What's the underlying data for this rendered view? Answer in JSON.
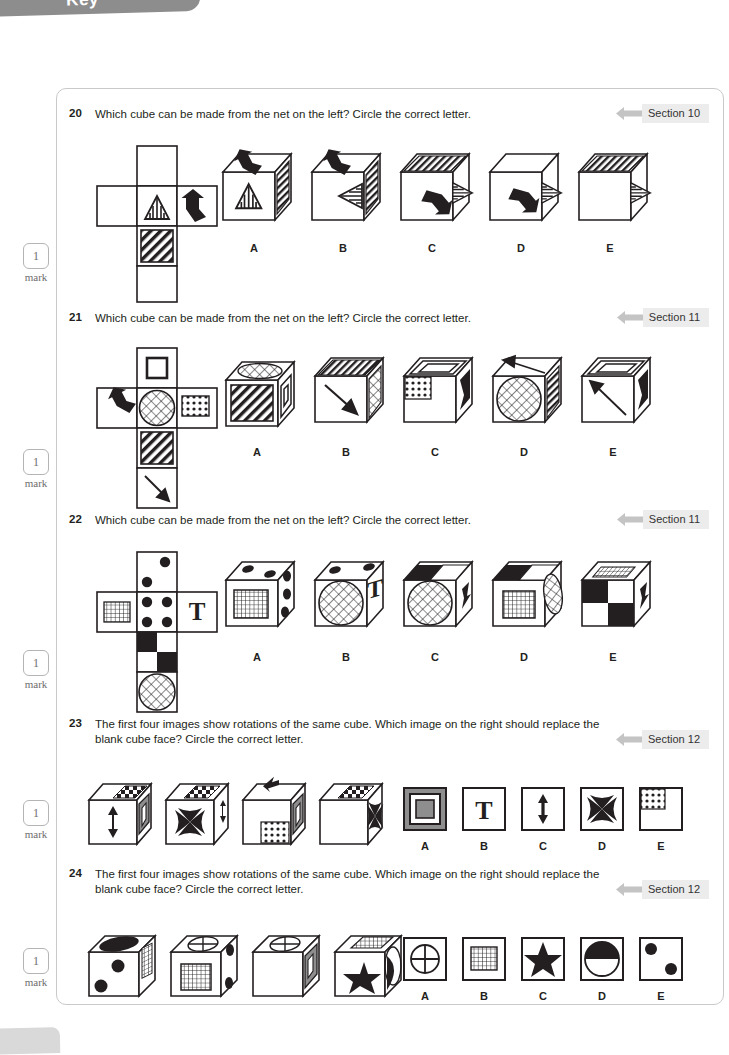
{
  "page": {
    "header_tab_text": "Key",
    "mark_chips": [
      {
        "num": "1",
        "label": "mark"
      },
      {
        "num": "1",
        "label": "mark"
      },
      {
        "num": "1",
        "label": "mark"
      },
      {
        "num": "1",
        "label": "mark"
      },
      {
        "num": "1",
        "label": "mark"
      }
    ]
  },
  "questions": [
    {
      "number": "20",
      "text": "Which cube can be made from the net on the left? Circle the correct letter.",
      "section": "Section 10",
      "options": [
        "A",
        "B",
        "C",
        "D",
        "E"
      ],
      "net": {
        "type": "cross-net",
        "faces": [
          {
            "cell": "top",
            "pattern": "blank"
          },
          {
            "cell": "middle-left",
            "pattern": "blank"
          },
          {
            "cell": "middle-center",
            "pattern": "striped-triangle"
          },
          {
            "cell": "middle-right",
            "pattern": "bold-arrow-up-left"
          },
          {
            "cell": "lower-center",
            "pattern": "diagonal-stripes"
          },
          {
            "cell": "bottom",
            "pattern": "blank"
          }
        ]
      },
      "choices": [
        {
          "letter": "A",
          "front": "striped-triangle-up",
          "top": "bold-arrow-up-left",
          "side": "diagonal-stripes"
        },
        {
          "letter": "B",
          "front": "striped-triangle-left",
          "top": "bold-arrow-up-left",
          "side": "diagonal-stripes"
        },
        {
          "letter": "C",
          "front": "bold-arrow-down-right",
          "top": "diagonal-stripes",
          "side": "striped-triangle"
        },
        {
          "letter": "D",
          "front": "bold-arrow-down-right",
          "top": "blank",
          "side": "striped-triangle"
        },
        {
          "letter": "E",
          "front": "blank",
          "top": "diagonal-stripes",
          "side": "striped-triangle"
        }
      ]
    },
    {
      "number": "21",
      "text": "Which cube can be made from the net on the left? Circle the correct letter.",
      "section": "Section 11",
      "options": [
        "A",
        "B",
        "C",
        "D",
        "E"
      ],
      "net": {
        "type": "cross-net",
        "faces": [
          {
            "cell": "top",
            "pattern": "square-outline"
          },
          {
            "cell": "middle-left",
            "pattern": "bold-arrow-up-left"
          },
          {
            "cell": "middle-center",
            "pattern": "crosshatch-circle"
          },
          {
            "cell": "middle-right",
            "pattern": "polka-dots"
          },
          {
            "cell": "lower-center",
            "pattern": "diagonal-stripes"
          },
          {
            "cell": "bottom",
            "pattern": "thin-arrow-down-right"
          }
        ]
      },
      "choices": [
        {
          "letter": "A",
          "front": "diagonal-stripes",
          "top": "crosshatch-ellipse",
          "side": "square-outline"
        },
        {
          "letter": "B",
          "front": "thin-arrow-down-right",
          "top": "diagonal-stripes",
          "side": "crosshatch"
        },
        {
          "letter": "C",
          "front": "polka-dots-corner",
          "top": "square-outline",
          "side": "bold-arrow"
        },
        {
          "letter": "D",
          "front": "crosshatch-circle",
          "top": "thin-arrow-up-left",
          "side": "diagonal-stripes"
        },
        {
          "letter": "E",
          "front": "thin-arrow-up-left",
          "top": "square-outline",
          "side": "bold-arrow"
        }
      ]
    },
    {
      "number": "22",
      "text": "Which cube can be made from the net on the left? Circle the correct letter.",
      "section": "Section 11",
      "options": [
        "A",
        "B",
        "C",
        "D",
        "E"
      ],
      "net": {
        "type": "cross-net",
        "faces": [
          {
            "cell": "top",
            "pattern": "dice-one-dot"
          },
          {
            "cell": "middle-left",
            "pattern": "fine-grid"
          },
          {
            "cell": "middle-center",
            "pattern": "dice-five-dots"
          },
          {
            "cell": "middle-right",
            "pattern": "letter-T"
          },
          {
            "cell": "lower-center",
            "pattern": "checker-quad"
          },
          {
            "cell": "bottom",
            "pattern": "crosshatch-circle"
          }
        ]
      },
      "choices": [
        {
          "letter": "A",
          "front": "fine-grid",
          "top": "dice-dots",
          "side": "dice-dots"
        },
        {
          "letter": "B",
          "front": "crosshatch-circle",
          "top": "dice-dots",
          "side": "letter-T"
        },
        {
          "letter": "C",
          "front": "crosshatch-circle",
          "top": "checker-quad",
          "side": "letter-T"
        },
        {
          "letter": "D",
          "front": "fine-grid",
          "top": "checker-quad",
          "side": "crosshatch-ellipse"
        },
        {
          "letter": "E",
          "front": "checker-quad",
          "top": "fine-grid",
          "side": "letter-T"
        }
      ]
    },
    {
      "number": "23",
      "text": "The first four images show rotations of the same cube. Which image on the right should replace the blank cube face? Circle the correct letter.",
      "section": "Section 12",
      "options": [
        "A",
        "B",
        "C",
        "D",
        "E"
      ],
      "cubes": [
        {
          "front": "double-arrow-vertical",
          "top": "checkerboard",
          "side": "grey-square-frame"
        },
        {
          "front": "four-point-star-burst",
          "top": "checkerboard",
          "side": "double-arrow-vertical"
        },
        {
          "front": "polka-dots-corner",
          "top": "letter-T-rotated",
          "side": "grey-square-frame"
        },
        {
          "front": "blank",
          "top": "checkerboard",
          "side": "four-point-star-burst"
        }
      ],
      "choices": [
        {
          "letter": "A",
          "pattern": "grey-square-frame"
        },
        {
          "letter": "B",
          "pattern": "letter-T"
        },
        {
          "letter": "C",
          "pattern": "double-arrow-vertical"
        },
        {
          "letter": "D",
          "pattern": "four-point-star-burst"
        },
        {
          "letter": "E",
          "pattern": "polka-dots-corner"
        }
      ]
    },
    {
      "number": "24",
      "text": "The first four images show rotations of the same cube. Which image on the right should replace the blank cube face? Circle the correct letter.",
      "section": "Section 12",
      "options": [
        "A",
        "B",
        "C",
        "D",
        "E"
      ],
      "cubes": [
        {
          "front": "two-dots",
          "top": "half-filled-ellipse",
          "side": "fine-grid"
        },
        {
          "front": "fine-grid",
          "top": "crossed-circle",
          "side": "two-dots"
        },
        {
          "front": "blank",
          "top": "crossed-circle",
          "side": "grey-square-frame"
        },
        {
          "front": "five-point-star",
          "top": "fine-grid",
          "side": "half-filled-ellipse"
        }
      ],
      "choices": [
        {
          "letter": "A",
          "pattern": "crossed-circle"
        },
        {
          "letter": "B",
          "pattern": "fine-grid"
        },
        {
          "letter": "C",
          "pattern": "five-point-star"
        },
        {
          "letter": "D",
          "pattern": "half-filled-circle"
        },
        {
          "letter": "E",
          "pattern": "two-dots"
        }
      ]
    }
  ],
  "colors": {
    "ink": "#231f20",
    "panel_border": "#c9c9c9",
    "section_bg": "#ececec",
    "section_arrow": "#c4c4c4",
    "mark_grey": "#6d6d6d",
    "tab_grey": "#8d8d8d"
  }
}
